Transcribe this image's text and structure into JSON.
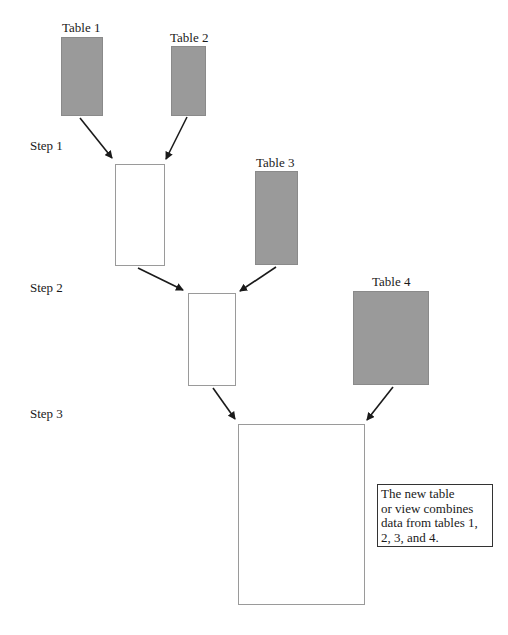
{
  "diagram": {
    "tables": [
      {
        "label": "Table 1"
      },
      {
        "label": "Table 2"
      },
      {
        "label": "Table 3"
      },
      {
        "label": "Table 4"
      }
    ],
    "steps": [
      {
        "label": "Step 1"
      },
      {
        "label": "Step 2"
      },
      {
        "label": "Step 3"
      }
    ],
    "note": {
      "lines": [
        "The new table",
        "or view combines",
        "data from tables 1,",
        "2, 3, and 4."
      ]
    },
    "colors": {
      "source_table_fill": "#9a9a9a",
      "result_border": "#9a9a9a",
      "arrow": "#1a1a1a"
    }
  }
}
